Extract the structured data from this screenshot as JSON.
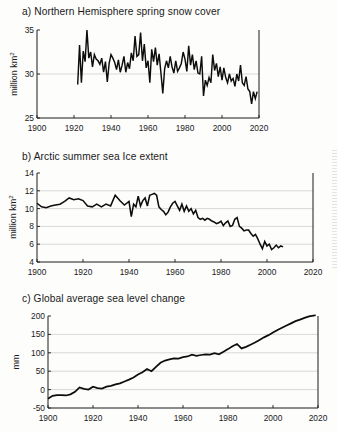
{
  "figure": {
    "background": "#fdfdfc",
    "line_color": "#0d0d0d",
    "grid_color": "#c9c9c9"
  },
  "panels": [
    {
      "id": "a",
      "title": "a) Northern Hemisphere spring snow cover",
      "ylabel_main": "million km",
      "ylabel_sup": "2",
      "xticks": [
        "1900",
        "1920",
        "1940",
        "1960",
        "1980",
        "2000",
        "2020"
      ],
      "yticks": [
        "25",
        "30",
        "35"
      ]
    },
    {
      "id": "b",
      "title": "b) Arctic summer sea Ice extent",
      "ylabel_main": "million km",
      "ylabel_sup": "2",
      "xticks": [
        "1900",
        "1920",
        "1940",
        "1960",
        "1980",
        "2000",
        "2020"
      ],
      "yticks": [
        "4",
        "6",
        "8",
        "10",
        "12",
        "14"
      ]
    },
    {
      "id": "c",
      "title": "c) Global average sea level change",
      "ylabel_main": "mm",
      "ylabel_sup": "",
      "xticks": [
        "1900",
        "1920",
        "1940",
        "1960",
        "1980",
        "2000",
        "2020"
      ],
      "yticks": [
        "-50",
        "0",
        "50",
        "100",
        "150",
        "200"
      ]
    }
  ],
  "chart_data": [
    {
      "type": "line",
      "panel": "a",
      "title": "a) Northern Hemisphere spring snow cover",
      "xlabel": "",
      "ylabel": "million km2",
      "xlim": [
        1900,
        2020
      ],
      "ylim": [
        25,
        35
      ],
      "grid": true,
      "gridlines_y": [
        30
      ],
      "x": [
        1922,
        1923,
        1924,
        1925,
        1926,
        1927,
        1928,
        1929,
        1930,
        1931,
        1932,
        1933,
        1934,
        1935,
        1936,
        1937,
        1938,
        1939,
        1940,
        1941,
        1942,
        1943,
        1944,
        1945,
        1946,
        1947,
        1948,
        1949,
        1950,
        1951,
        1952,
        1953,
        1954,
        1955,
        1956,
        1957,
        1958,
        1959,
        1960,
        1961,
        1962,
        1963,
        1964,
        1965,
        1966,
        1967,
        1968,
        1969,
        1970,
        1971,
        1972,
        1973,
        1974,
        1975,
        1976,
        1977,
        1978,
        1979,
        1980,
        1981,
        1982,
        1983,
        1984,
        1985,
        1986,
        1987,
        1988,
        1989,
        1990,
        1991,
        1992,
        1993,
        1994,
        1995,
        1996,
        1997,
        1998,
        1999,
        2000,
        2001,
        2002,
        2003,
        2004,
        2005,
        2006,
        2007,
        2008,
        2009,
        2010,
        2011,
        2012,
        2013,
        2014,
        2015,
        2016,
        2017,
        2018,
        2019
      ],
      "values": [
        28.8,
        33.3,
        29.0,
        32.6,
        31.4,
        35.0,
        31.8,
        32.5,
        30.8,
        32.2,
        31.7,
        31.5,
        31.1,
        31.8,
        30.2,
        31.4,
        29.1,
        31.2,
        32.2,
        31.8,
        31.3,
        30.5,
        31.6,
        30.2,
        31.0,
        32.0,
        30.2,
        31.3,
        30.6,
        32.4,
        31.5,
        34.3,
        32.0,
        32.2,
        34.7,
        31.5,
        33.4,
        30.7,
        31.5,
        29.0,
        32.8,
        31.4,
        33.0,
        31.0,
        32.3,
        30.1,
        27.8,
        30.6,
        31.5,
        30.7,
        32.0,
        30.8,
        30.1,
        31.5,
        30.3,
        30.7,
        31.2,
        32.5,
        31.7,
        30.3,
        33.2,
        31.0,
        32.2,
        30.5,
        31.5,
        30.1,
        30.0,
        32.0,
        27.5,
        29.3,
        28.7,
        29.6,
        29.0,
        32.2,
        30.4,
        31.2,
        29.7,
        30.8,
        29.3,
        30.7,
        29.6,
        29.0,
        30.0,
        29.2,
        29.5,
        28.6,
        30.0,
        29.2,
        31.0,
        29.0,
        28.7,
        29.7,
        28.3,
        28.0,
        26.6,
        28.0,
        27.2,
        28.0
      ]
    },
    {
      "type": "line",
      "panel": "b",
      "title": "b) Arctic summer sea Ice extent",
      "xlabel": "",
      "ylabel": "million km2",
      "xlim": [
        1900,
        2020
      ],
      "ylim": [
        4,
        14
      ],
      "grid": true,
      "gridlines_y": [
        6,
        8,
        10,
        12
      ],
      "x": [
        1900,
        1902,
        1904,
        1906,
        1908,
        1910,
        1912,
        1914,
        1916,
        1918,
        1920,
        1922,
        1924,
        1926,
        1928,
        1930,
        1932,
        1934,
        1936,
        1938,
        1940,
        1941,
        1942,
        1943,
        1944,
        1945,
        1946,
        1947,
        1948,
        1949,
        1950,
        1951,
        1952,
        1953,
        1954,
        1955,
        1956,
        1957,
        1958,
        1959,
        1960,
        1961,
        1962,
        1963,
        1964,
        1965,
        1966,
        1967,
        1968,
        1969,
        1970,
        1971,
        1972,
        1973,
        1974,
        1975,
        1976,
        1977,
        1978,
        1979,
        1980,
        1981,
        1982,
        1983,
        1984,
        1985,
        1986,
        1987,
        1988,
        1989,
        1990,
        1991,
        1992,
        1993,
        1994,
        1995,
        1996,
        1997,
        1998,
        1999,
        2000,
        2001,
        2002,
        2003,
        2004,
        2005,
        2006,
        2007,
        2008,
        2009,
        2010,
        2011,
        2012,
        2013,
        2014,
        2015,
        2016,
        2017,
        2018,
        2019
      ],
      "values": [
        10.6,
        10.2,
        10.1,
        10.3,
        10.4,
        10.5,
        10.8,
        11.2,
        11.0,
        11.1,
        10.9,
        10.3,
        10.2,
        10.5,
        10.2,
        10.5,
        10.3,
        11.5,
        10.9,
        10.4,
        10.8,
        9.1,
        10.5,
        10.2,
        11.4,
        10.3,
        10.9,
        11.2,
        10.3,
        11.5,
        11.6,
        11.7,
        11.5,
        10.2,
        9.9,
        9.7,
        9.3,
        9.6,
        10.2,
        10.6,
        10.8,
        10.3,
        9.8,
        10.5,
        9.7,
        10.3,
        9.7,
        10.0,
        9.4,
        9.8,
        9.0,
        8.8,
        8.9,
        8.7,
        8.9,
        8.8,
        8.6,
        8.5,
        8.3,
        8.4,
        8.6,
        8.1,
        8.4,
        8.6,
        8.0,
        8.1,
        8.8,
        9.0,
        8.0,
        7.8,
        7.5,
        7.6,
        7.6,
        7.2,
        6.9,
        7.1,
        6.6,
        6.0,
        5.5,
        6.3,
        5.8,
        6.0,
        5.4,
        5.6,
        5.9,
        5.6,
        5.8,
        5.7
      ]
    },
    {
      "type": "line",
      "panel": "c",
      "title": "c) Global average sea level change",
      "xlabel": "",
      "ylabel": "mm",
      "xlim": [
        1900,
        2020
      ],
      "ylim": [
        -50,
        200
      ],
      "grid": true,
      "gridlines_y": [
        -50,
        0,
        50,
        100,
        150,
        200
      ],
      "x": [
        1900,
        1902,
        1904,
        1906,
        1908,
        1910,
        1912,
        1914,
        1916,
        1918,
        1920,
        1922,
        1924,
        1926,
        1928,
        1930,
        1932,
        1934,
        1936,
        1938,
        1940,
        1942,
        1944,
        1946,
        1948,
        1950,
        1952,
        1954,
        1956,
        1958,
        1960,
        1962,
        1964,
        1966,
        1968,
        1970,
        1972,
        1974,
        1976,
        1978,
        1980,
        1982,
        1984,
        1986,
        1988,
        1990,
        1992,
        1994,
        1996,
        1998,
        2000,
        2002,
        2004,
        2006,
        2008,
        2010,
        2012,
        2014,
        2016,
        2018,
        2019
      ],
      "values": [
        -25,
        -17,
        -15,
        -15,
        -16,
        -13,
        -6,
        6,
        2,
        0,
        8,
        4,
        3,
        8,
        10,
        14,
        17,
        22,
        27,
        33,
        41,
        47,
        56,
        50,
        62,
        73,
        79,
        82,
        85,
        84,
        88,
        90,
        95,
        92,
        94,
        96,
        95,
        99,
        96,
        103,
        110,
        118,
        124,
        112,
        116,
        122,
        128,
        135,
        142,
        148,
        155,
        162,
        168,
        174,
        180,
        186,
        190,
        195,
        199,
        201,
        202
      ]
    }
  ]
}
